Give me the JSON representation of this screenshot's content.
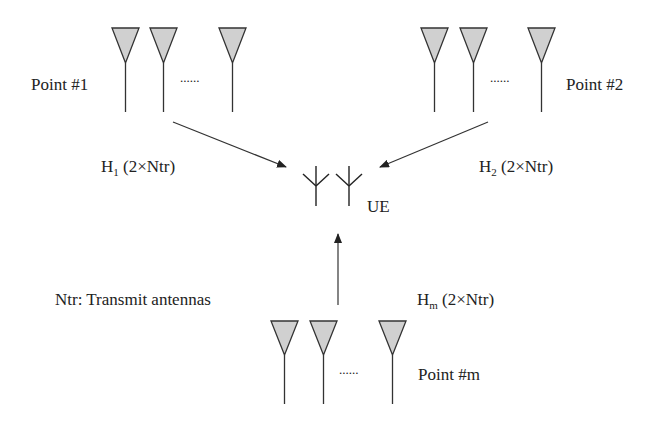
{
  "diagram": {
    "points": [
      {
        "id": "point-1",
        "label": "Point #1",
        "dots": "......"
      },
      {
        "id": "point-2",
        "label": "Point #2",
        "dots": "......"
      },
      {
        "id": "point-m",
        "label": "Point #m",
        "dots": "......"
      }
    ],
    "channels": [
      {
        "base": "H",
        "sub": "1",
        "dims": " (2×Ntr)"
      },
      {
        "base": "H",
        "sub": "2",
        "dims": " (2×Ntr)"
      },
      {
        "base": "H",
        "sub": "m",
        "dims": " (2×Ntr)"
      }
    ],
    "ue_label": "UE",
    "legend": "Ntr: Transmit antennas",
    "colors": {
      "antenna_fill": "#d0d0d0",
      "stroke": "#333333"
    }
  }
}
